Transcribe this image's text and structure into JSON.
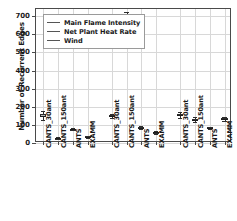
{
  "chart_data": {
    "type": "box",
    "title": "",
    "xlabel": "",
    "ylabel": "Number of Recurrent Edges",
    "ylim": [
      0,
      740
    ],
    "yticks": [
      0,
      100,
      200,
      300,
      400,
      500,
      600,
      700
    ],
    "grid": true,
    "legend_position": "upper left",
    "legend": [
      "Main Flame Intensity",
      "Net Plant Heat Rate",
      "Wind"
    ],
    "methods": [
      "CANTS_30ant",
      "CANTS_150ant",
      "ANTS",
      "EXAMM"
    ],
    "categories": [
      "CANTS_30ant",
      "CANTS_150ant",
      "ANTS",
      "EXAMM",
      "CANTS_30ant",
      "CANTS_150ant",
      "ANTS",
      "EXAMM",
      "CANTS_30ant",
      "CANTS_150ant",
      "ANTS",
      "EXAMM"
    ],
    "series": [
      {
        "name": "Main Flame Intensity",
        "boxes": [
          {
            "category": "CANTS_30ant",
            "whisker_low": 126,
            "q1": 142,
            "median": 150,
            "q3": 159,
            "whisker_high": 176,
            "fliers": []
          },
          {
            "category": "CANTS_150ant",
            "whisker_low": 22,
            "q1": 25,
            "median": 27,
            "q3": 29,
            "whisker_high": 33,
            "fliers": []
          },
          {
            "category": "ANTS",
            "whisker_low": 72,
            "q1": 76,
            "median": 78,
            "q3": 80,
            "whisker_high": 84,
            "fliers": []
          },
          {
            "category": "EXAMM",
            "whisker_low": 28,
            "q1": 31,
            "median": 33,
            "q3": 36,
            "whisker_high": 40,
            "fliers": []
          }
        ]
      },
      {
        "name": "Net Plant Heat Rate",
        "boxes": [
          {
            "category": "CANTS_30ant",
            "whisker_low": 136,
            "q1": 143,
            "median": 148,
            "q3": 153,
            "whisker_high": 160,
            "fliers": []
          },
          {
            "category": "CANTS_150ant",
            "whisker_low": 632,
            "q1": 661,
            "median": 678,
            "q3": 697,
            "whisker_high": 722,
            "fliers": []
          },
          {
            "category": "ANTS",
            "whisker_low": 79,
            "q1": 83,
            "median": 85,
            "q3": 88,
            "whisker_high": 92,
            "fliers": []
          },
          {
            "category": "EXAMM",
            "whisker_low": 52,
            "q1": 56,
            "median": 58,
            "q3": 61,
            "whisker_high": 66,
            "fliers": []
          }
        ]
      },
      {
        "name": "Wind",
        "boxes": [
          {
            "category": "CANTS_30ant",
            "whisker_low": 140,
            "q1": 150,
            "median": 155,
            "q3": 161,
            "whisker_high": 172,
            "fliers": []
          },
          {
            "category": "CANTS_150ant",
            "whisker_low": 116,
            "q1": 124,
            "median": 128,
            "q3": 133,
            "whisker_high": 142,
            "fliers": []
          },
          {
            "category": "ANTS",
            "whisker_low": 77,
            "q1": 81,
            "median": 83,
            "q3": 86,
            "whisker_high": 90,
            "fliers": []
          },
          {
            "category": "EXAMM",
            "whisker_low": 124,
            "q1": 130,
            "median": 133,
            "q3": 137,
            "whisker_high": 144,
            "fliers": []
          }
        ]
      }
    ],
    "colors": {
      "box_face": "#b9b9b9",
      "box_edge": "#2e2e2e",
      "median": "#1d1d1d",
      "grid": "#d8d8d8",
      "axis": "#4a4a4a",
      "text": "#1a1a1a"
    }
  }
}
